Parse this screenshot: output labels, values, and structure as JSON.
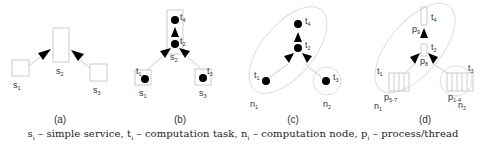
{
  "figure": {
    "panels": [
      {
        "id": "a",
        "label": "(a)",
        "x": 60
      },
      {
        "id": "b",
        "label": "(b)",
        "x": 180
      },
      {
        "id": "c",
        "label": "(c)",
        "x": 293
      },
      {
        "id": "d",
        "label": "(d)",
        "x": 425
      }
    ],
    "nodes": {
      "s1": "s",
      "s1_sub": "1",
      "s2": "s",
      "s2_sub": "2",
      "s3": "s",
      "s3_sub": "3",
      "t1": "t",
      "t1_sub": "1",
      "t2": "t",
      "t2_sub": "2",
      "t3": "t",
      "t3_sub": "3",
      "t4": "t",
      "t4_sub": "4",
      "n1": "n",
      "n1_sub": "1",
      "n2": "n",
      "n2_sub": "2",
      "p8": "p",
      "p8_sub": "8",
      "p9": "p",
      "p9_sub": "9",
      "p57": "p",
      "p57_sub": "5-7",
      "p14": "p",
      "p14_sub": "1-4"
    },
    "caption": {
      "s_sym": "s",
      "s_sub": "i",
      "s_desc": " – simple service, ",
      "t_sym": "t",
      "t_sub": "i",
      "t_desc": " – computation task, ",
      "n_sym": "n",
      "n_sub": "i",
      "n_desc": " – computation node, ",
      "p_sym": "p",
      "p_sub": "i",
      "p_desc": " – process/thread"
    },
    "colors": {
      "line": "#cccccc",
      "arrow": "#000000",
      "dot": "#000000",
      "text": "#333333"
    }
  }
}
